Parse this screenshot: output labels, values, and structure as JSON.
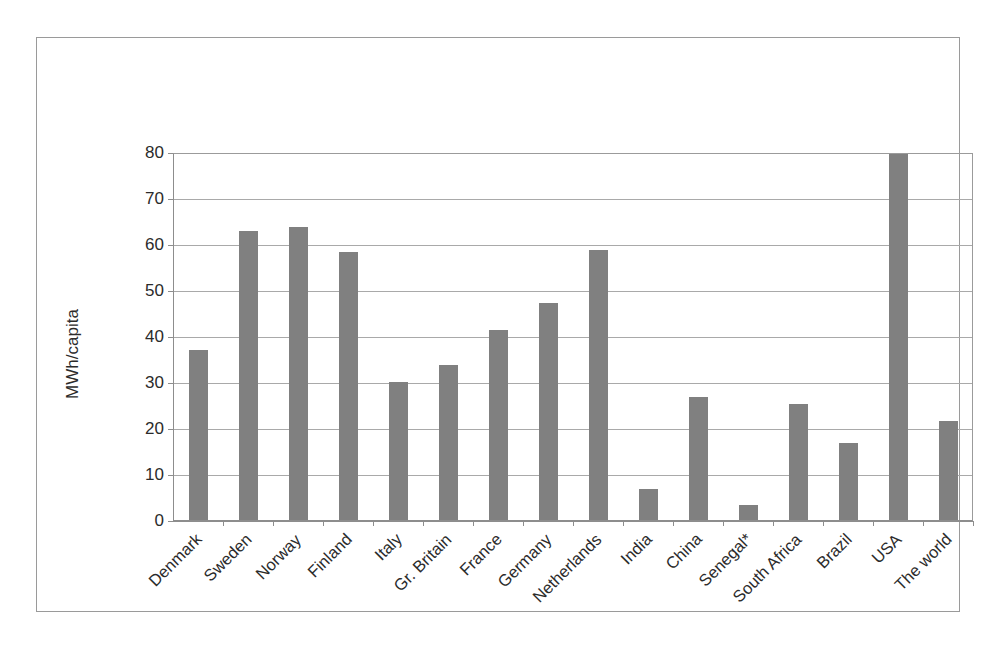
{
  "chart_data": {
    "type": "bar",
    "title": "",
    "subtitle": "",
    "xlabel": "",
    "ylabel": "MWh/capita",
    "ylim": [
      0,
      80
    ],
    "ytick_values": [
      0,
      10,
      20,
      30,
      40,
      50,
      60,
      70,
      80
    ],
    "ytick_labels": [
      "0",
      "10",
      "20",
      "30",
      "40",
      "50",
      "60",
      "70",
      "80"
    ],
    "grid": true,
    "legend": null,
    "bar_color": "#808080",
    "categories": [
      "Denmark",
      "Sweden",
      "Norway",
      "Finland",
      "Italy",
      "Gr. Britain",
      "France",
      "Germany",
      "Netherlands",
      "India",
      "China",
      "Senegal*",
      "South Africa",
      "Brazil",
      "USA",
      "The world"
    ],
    "values": [
      37.2,
      63.0,
      64.0,
      58.5,
      30.2,
      34.0,
      41.5,
      47.5,
      59.0,
      7.0,
      27.0,
      3.5,
      25.5,
      17.0,
      81.0,
      21.8
    ],
    "annotations": [
      "* Senegal value marked with asterisk"
    ]
  }
}
